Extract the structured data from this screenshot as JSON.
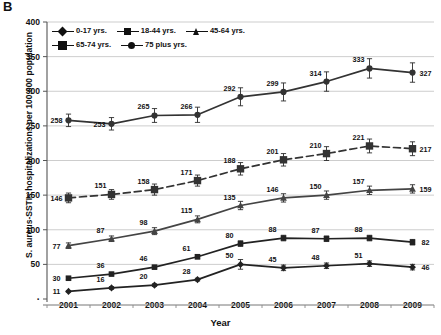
{
  "figure": {
    "panel_label": "B",
    "xlabel": "Year",
    "ylabel": "S. aureus-SSTIs hospitalizations per 100,000 population"
  },
  "legend": {
    "position": "top-left-inside",
    "items": [
      {
        "label": "0-17 yrs.",
        "marker": "diamond"
      },
      {
        "label": "18-44 yrs.",
        "marker": "square"
      },
      {
        "label": "45-64 yrs.",
        "marker": "triangle"
      },
      {
        "label": "65-74 yrs.",
        "marker": "bigsq"
      },
      {
        "label": "75 plus yrs.",
        "marker": "circ"
      }
    ]
  },
  "chart_data": {
    "type": "line",
    "title": "",
    "subtitle": "",
    "xlabel": "Year",
    "ylabel": "S. aureus-SSTIs hospitalizations per 100,000 population",
    "categories": [
      "2001",
      "2002",
      "2003",
      "2004",
      "2005",
      "2006",
      "2007",
      "2008",
      "2009"
    ],
    "x": [
      2001,
      2002,
      2003,
      2004,
      2005,
      2006,
      2007,
      2008,
      2009
    ],
    "ylim": [
      0,
      400
    ],
    "yticks": [
      0,
      50,
      100,
      150,
      200,
      250,
      300,
      350,
      400
    ],
    "ytick_labels": [
      "",
      "50",
      "100",
      "150",
      "200",
      "250",
      "300",
      "350",
      "400"
    ],
    "grid": "horizontal",
    "error_bars": true,
    "series": [
      {
        "name": "75 plus yrs.",
        "marker": "circle",
        "line": "solid",
        "color": "#333333",
        "values": [
          258,
          253,
          265,
          266,
          292,
          299,
          314,
          333,
          327
        ],
        "errors": [
          9,
          9,
          10,
          11,
          13,
          13,
          14,
          14,
          14
        ],
        "label_pos": [
          "left",
          "left",
          "above",
          "above",
          "above",
          "above",
          "above",
          "above",
          "right"
        ]
      },
      {
        "name": "65-74 yrs.",
        "marker": "bigsquare",
        "line": "dashed",
        "color": "#333333",
        "values": [
          146,
          151,
          158,
          171,
          188,
          201,
          210,
          221,
          217
        ],
        "errors": [
          7,
          7,
          8,
          8,
          9,
          9,
          10,
          10,
          10
        ],
        "label_pos": [
          "left",
          "above",
          "above",
          "above",
          "above",
          "above",
          "above",
          "above",
          "right"
        ]
      },
      {
        "name": "45-64 yrs.",
        "marker": "triangle",
        "line": "solid",
        "color": "#444444",
        "values": [
          77,
          87,
          98,
          115,
          135,
          146,
          150,
          157,
          159
        ],
        "errors": [
          4,
          4,
          5,
          5,
          6,
          6,
          6,
          6,
          6
        ],
        "label_pos": [
          "left",
          "above",
          "above",
          "above",
          "above",
          "above",
          "above",
          "above",
          "right"
        ]
      },
      {
        "name": "18-44 yrs.",
        "marker": "square",
        "line": "solid",
        "color": "#222222",
        "values": [
          30,
          36,
          46,
          61,
          80,
          88,
          87,
          88,
          82
        ],
        "errors": [
          2,
          2,
          2,
          3,
          4,
          4,
          4,
          4,
          4
        ],
        "label_pos": [
          "left",
          "above",
          "above",
          "above",
          "above",
          "above",
          "above",
          "above",
          "right"
        ]
      },
      {
        "name": "0-17 yrs.",
        "marker": "diamond",
        "line": "solid",
        "color": "#222222",
        "values": [
          11,
          16,
          20,
          28,
          50,
          45,
          48,
          51,
          46
        ],
        "errors": [
          1,
          2,
          2,
          2,
          7,
          4,
          4,
          4,
          4
        ],
        "label_pos": [
          "left",
          "above",
          "above",
          "above",
          "above",
          "above",
          "above",
          "above",
          "right"
        ]
      }
    ]
  }
}
